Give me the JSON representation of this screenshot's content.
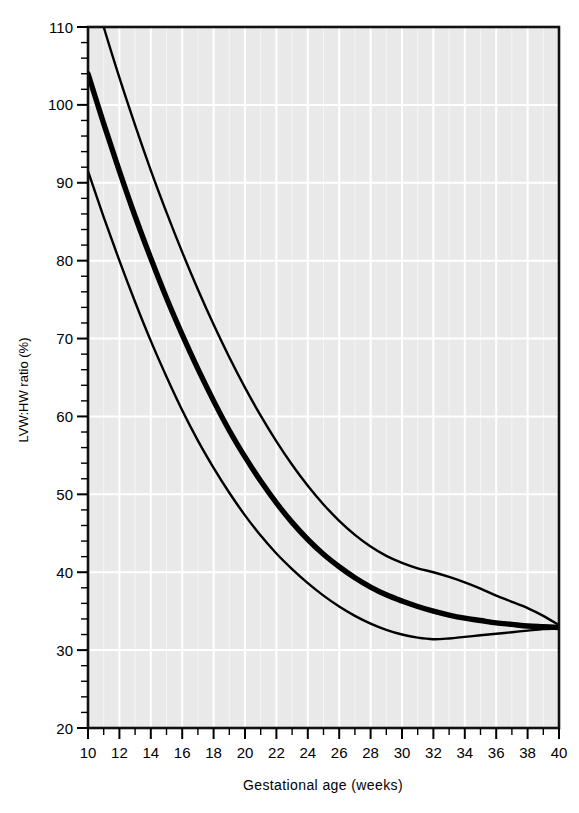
{
  "chart_data": {
    "type": "line",
    "title": "",
    "xlabel": "Gestational age (weeks)",
    "ylabel": "LVW:HW ratio (%)",
    "xlim": [
      10,
      40
    ],
    "ylim": [
      20,
      110
    ],
    "x_tick_labels": [
      "10",
      "12",
      "14",
      "16",
      "18",
      "20",
      "22",
      "24",
      "26",
      "28",
      "30",
      "32",
      "34",
      "36",
      "38",
      "40"
    ],
    "x_tick_values": [
      10,
      12,
      14,
      16,
      18,
      20,
      22,
      24,
      26,
      28,
      30,
      32,
      34,
      36,
      38,
      40
    ],
    "x_minor_tick_step": 1,
    "y_tick_labels": [
      "20",
      "30",
      "40",
      "50",
      "60",
      "70",
      "80",
      "90",
      "100",
      "110"
    ],
    "y_tick_values": [
      20,
      30,
      40,
      50,
      60,
      70,
      80,
      90,
      100,
      110
    ],
    "y_minor_tick_step": 2,
    "grid": "white gridlines on light grey panel, major x every 2 weeks, major y every 10%",
    "legend": "none",
    "x": [
      10,
      11,
      12,
      13,
      14,
      15,
      16,
      17,
      18,
      19,
      20,
      21,
      22,
      23,
      24,
      25,
      26,
      27,
      28,
      29,
      30,
      31,
      32,
      33,
      34,
      35,
      36,
      37,
      38,
      39,
      40
    ],
    "series": [
      {
        "name": "upper limit",
        "values": [
          117.0,
          110.0,
          103.5,
          97.4,
          91.6,
          86.2,
          81.1,
          76.3,
          71.8,
          67.6,
          63.7,
          60.1,
          56.8,
          53.8,
          51.1,
          48.7,
          46.6,
          44.8,
          43.3,
          42.1,
          41.2,
          40.5,
          40.0,
          39.4,
          38.7,
          37.9,
          37.0,
          36.2,
          35.4,
          34.4,
          33.2
        ]
      },
      {
        "name": "median",
        "values": [
          104.0,
          97.6,
          91.5,
          85.7,
          80.3,
          75.2,
          70.5,
          66.1,
          62.0,
          58.2,
          54.8,
          51.7,
          48.9,
          46.4,
          44.2,
          42.3,
          40.7,
          39.3,
          38.1,
          37.1,
          36.3,
          35.6,
          35.0,
          34.5,
          34.1,
          33.8,
          33.5,
          33.3,
          33.1,
          33.0,
          32.9
        ]
      },
      {
        "name": "lower limit",
        "values": [
          91.5,
          85.6,
          80.0,
          74.7,
          69.7,
          65.1,
          60.8,
          56.9,
          53.4,
          50.2,
          47.3,
          44.7,
          42.4,
          40.4,
          38.6,
          37.0,
          35.6,
          34.4,
          33.4,
          32.6,
          32.0,
          31.6,
          31.4,
          31.5,
          31.7,
          31.9,
          32.1,
          32.3,
          32.5,
          32.7,
          32.8
        ]
      }
    ],
    "series_note": "three smooth reference-centile curves; thick central line is the median, thin outer lines are upper and lower limits",
    "annotations": []
  },
  "axes": {
    "y_axis_title": "LVW:HW ratio (%)",
    "x_axis_title": "Gestational age (weeks)"
  },
  "colors": {
    "panel_background": "#e9e9e9",
    "gridline": "#ffffff",
    "curve": "#000000",
    "axis": "#000000",
    "page_background": "#ffffff"
  }
}
